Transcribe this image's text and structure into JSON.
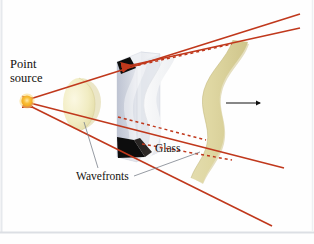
{
  "figure": {
    "type": "physics-optics-diagram",
    "background_color": "#fefefe",
    "border_color": "#dfe2e6"
  },
  "labels": {
    "point_source_line1": "Point",
    "point_source_line2": "source",
    "glass": "Glass",
    "wavefronts": "Wavefronts"
  },
  "colors": {
    "ray": "#c0381c",
    "ray_light": "#d4502f",
    "wavefront_near": "#f2edc4",
    "wavefront_far": "#d9d099",
    "wavefront_in_glass": "#f4f4f2",
    "glass_body": "#c9cdd9",
    "glass_face": "#dde0e8",
    "glass_top": "#eef0f4",
    "wedge": "#111111",
    "source_dot": "#f5a81c",
    "source_glow": "#fbd87a",
    "arrow": "#101010",
    "leader": "#6d7480"
  },
  "elements": {
    "source_dot": {
      "cx": 27,
      "cy": 101,
      "r": 6
    },
    "propagation_arrow": {
      "label": "direction of propagation",
      "x1": 226,
      "y1": 103,
      "x2": 262,
      "y2": 103
    },
    "rays": [
      {
        "name": "ray-upper-outer",
        "arrow": "backward"
      },
      {
        "name": "ray-upper-inner",
        "arrow": "backward"
      },
      {
        "name": "ray-middle",
        "arrow": "backward"
      },
      {
        "name": "ray-lower",
        "arrow": "backward"
      }
    ],
    "wavefronts": [
      {
        "name": "wavefront-near-source",
        "style": "spherical-cap",
        "color": "#f2edc4"
      },
      {
        "name": "wavefront-inside-glass",
        "style": "distorted-sheet",
        "color": "#f4f4f2"
      },
      {
        "name": "wavefront-emerging",
        "style": "s-curved-sheet",
        "color": "#d9d099"
      }
    ],
    "glass_slab": {
      "name": "glass-slab",
      "shape": "parallelepiped",
      "wedges": 2
    }
  }
}
